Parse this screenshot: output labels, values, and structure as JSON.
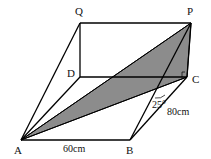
{
  "diagram": {
    "points": {
      "Q": {
        "label": "Q",
        "x": 80,
        "y": 23
      },
      "P": {
        "label": "P",
        "x": 191,
        "y": 23
      },
      "D": {
        "label": "D",
        "x": 80,
        "y": 77
      },
      "C": {
        "label": "C",
        "x": 187,
        "y": 77
      },
      "A": {
        "label": "A",
        "x": 21,
        "y": 140
      },
      "B": {
        "label": "B",
        "x": 130,
        "y": 140
      }
    },
    "measurements": {
      "AB": "60cm",
      "BC": "80cm",
      "angle": "25°"
    },
    "shaded_region": [
      "A",
      "P",
      "C"
    ],
    "colors": {
      "shade": "#8c8c8c",
      "line": "#000000"
    }
  }
}
